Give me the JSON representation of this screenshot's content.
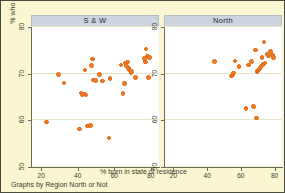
{
  "figure": {
    "xlabel": "% born in state of residence",
    "ylabel": "% who own home",
    "caption": "Graphs by Region North or Not",
    "marker_color": "#f17d28",
    "background_color": "#faf6d2",
    "panel_title_color": "#ccd4de",
    "plot_background": "#ffffff"
  },
  "chart_data": {
    "type": "scatter",
    "title": "",
    "subtitle": "",
    "xlabel": "% born in state of residence",
    "ylabel": "% who own home",
    "caption": "Graphs by Region North or Not",
    "xlim": [
      15,
      85
    ],
    "ylim": [
      50,
      80
    ],
    "xticks": [
      20,
      40,
      60,
      80
    ],
    "yticks": [
      50,
      60,
      70,
      80
    ],
    "grid": "horizontal",
    "legend": "none",
    "facet_by": "Region North or Not",
    "panels": [
      {
        "label": "S & W",
        "points": [
          {
            "x": 23.6,
            "y": 59.4
          },
          {
            "x": 30.2,
            "y": 69.6
          },
          {
            "x": 33.1,
            "y": 67.8
          },
          {
            "x": 41.4,
            "y": 57.9
          },
          {
            "x": 42.3,
            "y": 65.6
          },
          {
            "x": 43.2,
            "y": 65.3
          },
          {
            "x": 44.1,
            "y": 65.4
          },
          {
            "x": 44.5,
            "y": 70.6
          },
          {
            "x": 45.1,
            "y": 65.2
          },
          {
            "x": 46.0,
            "y": 58.6
          },
          {
            "x": 47.4,
            "y": 58.7
          },
          {
            "x": 48.2,
            "y": 71.5
          },
          {
            "x": 48.6,
            "y": 72.9
          },
          {
            "x": 49.1,
            "y": 68.4
          },
          {
            "x": 50.3,
            "y": 68.3
          },
          {
            "x": 52.6,
            "y": 69.6
          },
          {
            "x": 54.0,
            "y": 68.2
          },
          {
            "x": 57.6,
            "y": 56.0
          },
          {
            "x": 58.1,
            "y": 68.8
          },
          {
            "x": 64.2,
            "y": 71.6
          },
          {
            "x": 65.4,
            "y": 65.5
          },
          {
            "x": 66.0,
            "y": 67.7
          },
          {
            "x": 66.6,
            "y": 72.1
          },
          {
            "x": 67.2,
            "y": 71.4
          },
          {
            "x": 67.8,
            "y": 72.3
          },
          {
            "x": 68.4,
            "y": 71.0
          },
          {
            "x": 69.0,
            "y": 70.6
          },
          {
            "x": 69.6,
            "y": 70.0
          },
          {
            "x": 70.1,
            "y": 70.2
          },
          {
            "x": 72.0,
            "y": 69.0
          },
          {
            "x": 77.2,
            "y": 73.0
          },
          {
            "x": 77.6,
            "y": 72.3
          },
          {
            "x": 78.0,
            "y": 75.1
          },
          {
            "x": 78.6,
            "y": 73.6
          },
          {
            "x": 79.2,
            "y": 69.0
          },
          {
            "x": 79.8,
            "y": 73.2
          }
        ]
      },
      {
        "label": "North",
        "points": [
          {
            "x": 45.0,
            "y": 72.4
          },
          {
            "x": 55.0,
            "y": 69.3
          },
          {
            "x": 55.8,
            "y": 69.5
          },
          {
            "x": 56.4,
            "y": 69.9
          },
          {
            "x": 57.0,
            "y": 72.5
          },
          {
            "x": 59.6,
            "y": 71.3
          },
          {
            "x": 63.6,
            "y": 62.3
          },
          {
            "x": 65.2,
            "y": 71.6
          },
          {
            "x": 67.0,
            "y": 72.4
          },
          {
            "x": 68.0,
            "y": 62.7
          },
          {
            "x": 69.4,
            "y": 74.9
          },
          {
            "x": 69.8,
            "y": 60.3
          },
          {
            "x": 70.2,
            "y": 70.2
          },
          {
            "x": 70.8,
            "y": 70.4
          },
          {
            "x": 71.4,
            "y": 70.7
          },
          {
            "x": 72.0,
            "y": 70.9
          },
          {
            "x": 72.6,
            "y": 71.3
          },
          {
            "x": 73.2,
            "y": 73.3
          },
          {
            "x": 73.8,
            "y": 71.8
          },
          {
            "x": 74.4,
            "y": 76.6
          },
          {
            "x": 75.0,
            "y": 72.1
          },
          {
            "x": 76.2,
            "y": 74.0
          },
          {
            "x": 77.0,
            "y": 73.6
          },
          {
            "x": 78.2,
            "y": 74.5
          },
          {
            "x": 79.4,
            "y": 73.8
          },
          {
            "x": 80.0,
            "y": 73.3
          }
        ]
      }
    ]
  }
}
